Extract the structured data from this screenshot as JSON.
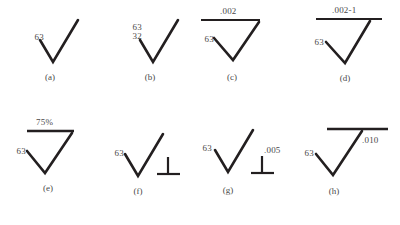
{
  "figure": {
    "title": "",
    "stroke_color": "#231f20",
    "text_color": "#4a4a4a",
    "background": "#ffffff",
    "columns": 4,
    "rows": 2
  },
  "panels": [
    {
      "id": "a",
      "caption": "(a)",
      "left_value": "63",
      "stacked_value": "",
      "bar_label": "",
      "has_bar": false,
      "has_perp": false,
      "perp_label": ""
    },
    {
      "id": "b",
      "caption": "(b)",
      "left_value": "63",
      "stacked_value": "32",
      "bar_label": "",
      "has_bar": false,
      "has_perp": false,
      "perp_label": ""
    },
    {
      "id": "c",
      "caption": "(c)",
      "left_value": "63",
      "stacked_value": "",
      "bar_label": ".002",
      "has_bar": true,
      "has_perp": false,
      "perp_label": ""
    },
    {
      "id": "d",
      "caption": "(d)",
      "left_value": "63",
      "stacked_value": "",
      "bar_label": ".002-1",
      "has_bar": true,
      "has_perp": false,
      "perp_label": ""
    },
    {
      "id": "e",
      "caption": "(e)",
      "left_value": "63",
      "stacked_value": "",
      "bar_label": "75%",
      "has_bar": true,
      "has_perp": false,
      "perp_label": ""
    },
    {
      "id": "f",
      "caption": "(f)",
      "left_value": "63",
      "stacked_value": "",
      "bar_label": "",
      "has_bar": false,
      "has_perp": true,
      "perp_label": ""
    },
    {
      "id": "g",
      "caption": "(g)",
      "left_value": "63",
      "stacked_value": "",
      "bar_label": "",
      "has_bar": false,
      "has_perp": true,
      "perp_label": ".005"
    },
    {
      "id": "h",
      "caption": "(h)",
      "left_value": "63",
      "stacked_value": "",
      "bar_label": ".010",
      "has_bar": true,
      "has_perp": false,
      "perp_label": ""
    }
  ]
}
